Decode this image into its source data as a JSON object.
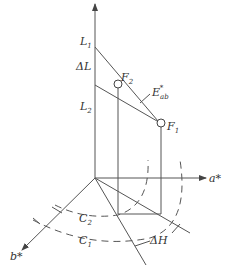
{
  "diagram": {
    "title": "",
    "labels": {
      "L1": {
        "main": "L",
        "sub": "1"
      },
      "deltaL": "ΔL",
      "L2": {
        "main": "L",
        "sub": "2"
      },
      "F2": {
        "main": "F",
        "sub": "2"
      },
      "F1": {
        "main": "F",
        "sub": "1"
      },
      "Eab": {
        "main": "E",
        "sub": "ab",
        "sup": "*"
      },
      "a_axis": "a*",
      "b_axis": "b*",
      "C2": {
        "main": "C",
        "sub": "2"
      },
      "C1": {
        "main": "C",
        "sub": "1"
      },
      "deltaH": "ΔH"
    },
    "colors": {
      "line": "#555555",
      "text": "#333333",
      "background": "#ffffff"
    }
  }
}
